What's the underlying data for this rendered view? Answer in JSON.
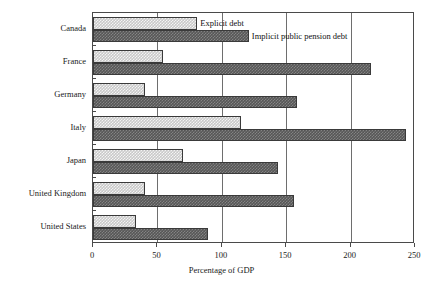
{
  "chart_data": {
    "type": "bar",
    "orientation": "horizontal",
    "title": "",
    "xlabel": "Percentage of GDP",
    "ylabel": "",
    "xlim": [
      0,
      250
    ],
    "xticks": [
      0,
      50,
      100,
      150,
      200,
      250
    ],
    "xtick_labels": [
      "0",
      "50",
      "100",
      "150",
      "200",
      "250"
    ],
    "grid": true,
    "grid_axis": "x",
    "legend_position": "inside-top",
    "categories": [
      "Canada",
      "France",
      "Germany",
      "Italy",
      "Japan",
      "United Kingdom",
      "United States"
    ],
    "series": [
      {
        "name": "Explicit debt",
        "color": "#c9c9c9",
        "values": [
          81,
          54,
          40,
          115,
          70,
          40,
          33
        ]
      },
      {
        "name": "Implicit public pension debt",
        "color": "#575757",
        "values": [
          121,
          216,
          158,
          243,
          144,
          156,
          89
        ]
      }
    ]
  },
  "legend": {
    "explicit_label": "Explicit debt",
    "implicit_label": "Implicit public pension debt"
  },
  "axis": {
    "x_title": "Percentage of GDP"
  }
}
